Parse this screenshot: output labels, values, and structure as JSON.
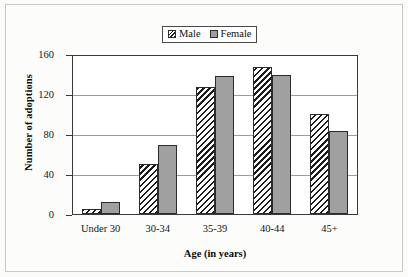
{
  "chart_data": {
    "type": "bar",
    "title": "",
    "subtitle": "",
    "xlabel": "Age (in years)",
    "ylabel": "Number of adoptions",
    "categories": [
      "Under 30",
      "30-34",
      "35-39",
      "40-44",
      "45+"
    ],
    "series": [
      {
        "name": "Male",
        "values": [
          5,
          50,
          127,
          147,
          100
        ],
        "color": "#ffffff",
        "pattern": "diagonal-hatch"
      },
      {
        "name": "Female",
        "values": [
          12,
          69,
          138,
          139,
          83
        ],
        "color": "#a0a0a0",
        "pattern": "solid"
      }
    ],
    "ylim": [
      0,
      160
    ],
    "yticks": [
      0,
      40,
      80,
      120,
      160
    ],
    "ytick_labels": [
      "0",
      "40",
      "80",
      "120",
      "160"
    ],
    "grid": "horizontal",
    "legend_position": "top-center",
    "orientation": "vertical",
    "grouping": "clustered"
  },
  "legend": {
    "entries": [
      {
        "label": "Male",
        "swatch": "hatched-swatch-icon"
      },
      {
        "label": "Female",
        "swatch": "solid-gray-swatch-icon"
      }
    ]
  },
  "axes": {
    "y": {
      "title": "Number of adoptions",
      "ticks": [
        "160",
        "120",
        "80",
        "40",
        "0"
      ]
    },
    "x": {
      "title": "Age (in years)",
      "ticks": [
        "Under 30",
        "30-34",
        "35-39",
        "40-44",
        "45+"
      ]
    }
  }
}
